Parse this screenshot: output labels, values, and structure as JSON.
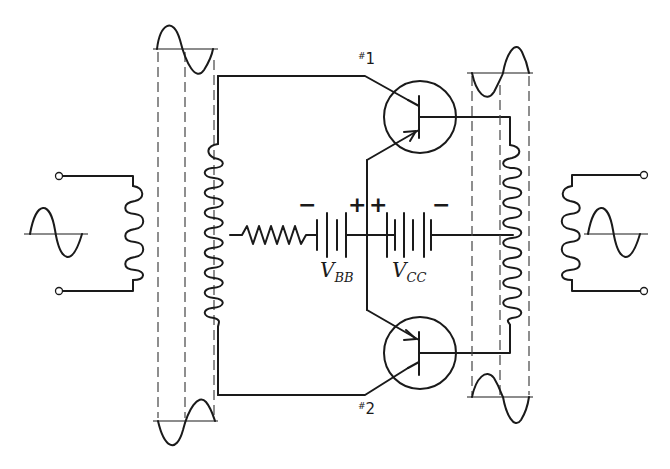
{
  "diagram": {
    "type": "circuit-schematic",
    "components": {
      "input_transformer": {
        "primary_coil_turns": 6,
        "secondary_coil_turns": 13
      },
      "output_transformer": {
        "primary_coil_turns": 13,
        "secondary_coil_turns": 6
      },
      "resistor": {
        "zigzags": 5
      },
      "battery_bb": {
        "label": "V",
        "subscript": "BB",
        "neg_sign": "−",
        "pos_sign": "+"
      },
      "battery_cc": {
        "label": "V",
        "subscript": "CC",
        "neg_sign": "−",
        "pos_sign": "+"
      },
      "transistor_1": {
        "hash": "#",
        "number": "1"
      },
      "transistor_2": {
        "hash": "#",
        "number": "2"
      }
    },
    "waveforms": [
      "input-sine",
      "input-top-sine",
      "input-bottom-sine",
      "output-top-sine",
      "output-bottom-sine",
      "output-sine"
    ]
  }
}
